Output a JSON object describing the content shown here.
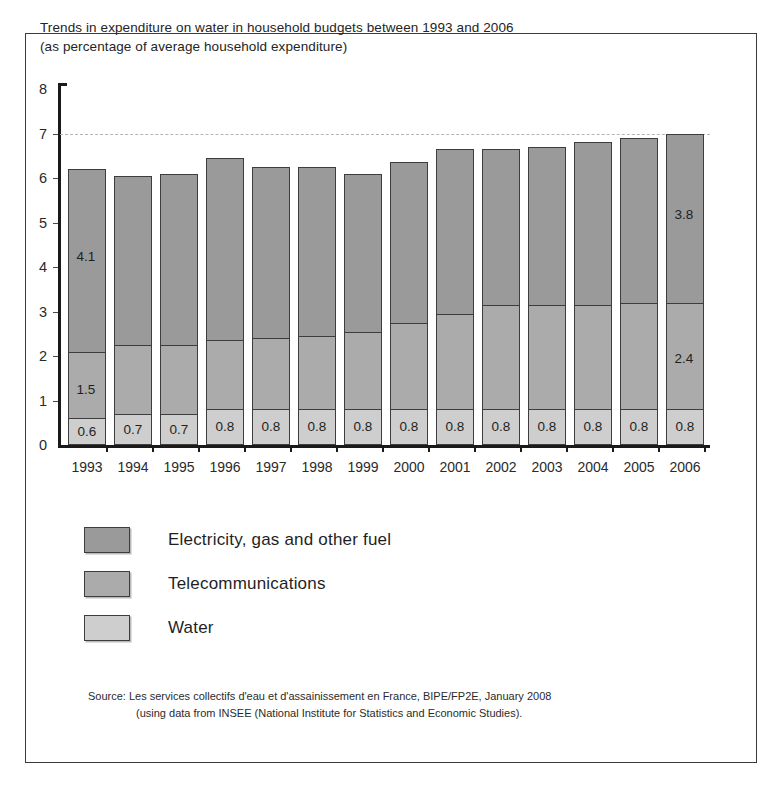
{
  "chart_title": {
    "line1": "Trends in expenditure on water in household budgets between 1993 and 2006",
    "line2": "(as percentage of average household expenditure)"
  },
  "legend": {
    "position": "below-plot",
    "items": [
      {
        "label": "Electricity, gas and other fuel",
        "color": "#9a9a9a",
        "swatch_name": "legend-swatch-electricity"
      },
      {
        "label": "Telecommunications",
        "color": "#ababab",
        "swatch_name": "legend-swatch-telecom"
      },
      {
        "label": "Water",
        "color": "#cecece",
        "swatch_name": "legend-swatch-water"
      }
    ]
  },
  "source_note": {
    "line1": "Source: Les services collectifs d'eau et d'assainissement en France, BIPE/FP2E, January 2008",
    "line2": "(using data from INSEE (National Institute for Statistics and Economic Studies)."
  },
  "chart_data": {
    "type": "bar",
    "stacked": true,
    "title": "Trends in expenditure on water in household budgets between 1993 and 2006 (as percentage of average household expenditure)",
    "xlabel": "",
    "ylabel": "",
    "ylim": [
      0,
      8
    ],
    "yticks": [
      0,
      1,
      2,
      3,
      4,
      5,
      6,
      7,
      8
    ],
    "ytick_labels": [
      "0",
      "1",
      "2",
      "3",
      "4",
      "5",
      "6",
      "7",
      "8"
    ],
    "grid": "dashed gridline at y = 7 only",
    "gridlines": [
      7
    ],
    "categories": [
      "1993",
      "1994",
      "1995",
      "1996",
      "1997",
      "1998",
      "1999",
      "2000",
      "2001",
      "2002",
      "2003",
      "2004",
      "2005",
      "2006"
    ],
    "series": [
      {
        "name": "Water",
        "color": "#cecece",
        "values": [
          0.6,
          0.7,
          0.7,
          0.8,
          0.8,
          0.8,
          0.8,
          0.8,
          0.8,
          0.8,
          0.8,
          0.8,
          0.8,
          0.8
        ],
        "data_labels": [
          "0.6",
          "0.7",
          "0.7",
          "0.8",
          "0.8",
          "0.8",
          "0.8",
          "0.8",
          "0.8",
          "0.8",
          "0.8",
          "0.8",
          "0.8",
          "0.8"
        ]
      },
      {
        "name": "Telecommunications",
        "color": "#ababab",
        "values": [
          1.5,
          1.55,
          1.55,
          1.55,
          1.6,
          1.65,
          1.75,
          1.95,
          2.15,
          2.35,
          2.35,
          2.35,
          2.4,
          2.4
        ],
        "data_labels": [
          "1.5",
          "",
          "",
          "",
          "",
          "",
          "",
          "",
          "",
          "",
          "",
          "",
          "",
          "2.4"
        ]
      },
      {
        "name": "Electricity, gas and other fuel",
        "color": "#9a9a9a",
        "values": [
          4.1,
          3.8,
          3.85,
          4.1,
          3.85,
          3.8,
          3.55,
          3.6,
          3.7,
          3.5,
          3.55,
          3.65,
          3.7,
          3.8
        ],
        "data_labels": [
          "4.1",
          "",
          "",
          "",
          "",
          "",
          "",
          "",
          "",
          "",
          "",
          "",
          "",
          "3.8"
        ]
      }
    ],
    "totals": [
      6.2,
      6.05,
      6.1,
      6.45,
      6.25,
      6.25,
      6.1,
      6.35,
      6.65,
      6.65,
      6.7,
      6.8,
      6.9,
      7.0
    ]
  }
}
